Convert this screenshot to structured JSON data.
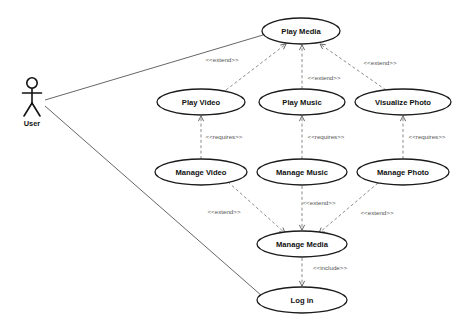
{
  "diagram": {
    "type": "uml-use-case-diagram",
    "background_color": "#ffffff",
    "stroke_color": "#111111",
    "dependency_color": "#777777",
    "actors": [
      {
        "id": "user",
        "label": "User",
        "x": 32,
        "y": 98,
        "label_x": 32,
        "label_y": 124
      }
    ],
    "use_cases": [
      {
        "id": "play_media",
        "label": "Play Media",
        "cx": 301,
        "cy": 31,
        "rx": 39,
        "ry": 13
      },
      {
        "id": "play_video",
        "label": "Play Video",
        "cx": 201,
        "cy": 102,
        "rx": 44,
        "ry": 13
      },
      {
        "id": "play_music",
        "label": "Play Music",
        "cx": 302,
        "cy": 102,
        "rx": 43,
        "ry": 13
      },
      {
        "id": "visualize_photo",
        "label": "Visualize Photo",
        "cx": 403,
        "cy": 102,
        "rx": 48,
        "ry": 13
      },
      {
        "id": "manage_video",
        "label": "Manage Video",
        "cx": 201,
        "cy": 172,
        "rx": 46,
        "ry": 13
      },
      {
        "id": "manage_music",
        "label": "Manage Music",
        "cx": 302,
        "cy": 172,
        "rx": 45,
        "ry": 13
      },
      {
        "id": "manage_photo",
        "label": "Manage Photo",
        "cx": 403,
        "cy": 172,
        "rx": 46,
        "ry": 13
      },
      {
        "id": "manage_media",
        "label": "Manage Media",
        "cx": 302,
        "cy": 244,
        "rx": 45,
        "ry": 13
      },
      {
        "id": "log_in",
        "label": "Log in",
        "cx": 302,
        "cy": 300,
        "rx": 45,
        "ry": 13
      }
    ],
    "associations": [
      {
        "id": "user-play-media",
        "from": "user",
        "to": "play_media",
        "x1": 45,
        "y1": 100,
        "x2": 263,
        "y2": 35
      },
      {
        "id": "user-log-in",
        "from": "user",
        "to": "log_in",
        "x1": 45,
        "y1": 106,
        "x2": 262,
        "y2": 296
      }
    ],
    "dependencies": [
      {
        "id": "play-video-extends-play-media",
        "from": "play_video",
        "to": "play_media",
        "stereotype": "<<extend>>",
        "label_x": 222,
        "label_y": 60,
        "x1": 226,
        "y1": 90,
        "x2": 286,
        "y2": 44
      },
      {
        "id": "play-music-extends-play-media",
        "from": "play_music",
        "to": "play_media",
        "stereotype": "<<extend>>",
        "label_x": 324,
        "label_y": 78,
        "x1": 302,
        "y1": 89,
        "x2": 302,
        "y2": 45
      },
      {
        "id": "visualize-photo-extends-play-media",
        "from": "visualize_photo",
        "to": "play_media",
        "stereotype": "<<extend>>",
        "label_x": 380,
        "label_y": 63,
        "x1": 386,
        "y1": 90,
        "x2": 320,
        "y2": 44
      },
      {
        "id": "manage-video-requires-play-video",
        "from": "manage_video",
        "to": "play_video",
        "stereotype": "<<requires>>",
        "label_x": 224,
        "label_y": 137,
        "x1": 201,
        "y1": 159,
        "x2": 201,
        "y2": 116
      },
      {
        "id": "manage-music-requires-play-music",
        "from": "manage_music",
        "to": "play_music",
        "stereotype": "<<requires>>",
        "label_x": 326,
        "label_y": 137,
        "x1": 302,
        "y1": 159,
        "x2": 302,
        "y2": 116
      },
      {
        "id": "manage-photo-requires-visualize",
        "from": "manage_photo",
        "to": "visualize_photo",
        "stereotype": "<<requires>>",
        "label_x": 427,
        "label_y": 137,
        "x1": 403,
        "y1": 159,
        "x2": 403,
        "y2": 116
      },
      {
        "id": "manage-video-extends-manage-media",
        "from": "manage_video",
        "to": "manage_media",
        "stereotype": "<<extend>>",
        "label_x": 224,
        "label_y": 212,
        "x1": 228,
        "y1": 182,
        "x2": 285,
        "y2": 233
      },
      {
        "id": "manage-music-extends-manage-media",
        "from": "manage_music",
        "to": "manage_media",
        "stereotype": "<<extend>>",
        "label_x": 319,
        "label_y": 203,
        "x1": 302,
        "y1": 186,
        "x2": 302,
        "y2": 230
      },
      {
        "id": "manage-photo-extends-manage-media",
        "from": "manage_photo",
        "to": "manage_media",
        "stereotype": "<<extend>>",
        "label_x": 377,
        "label_y": 213,
        "x1": 378,
        "y1": 183,
        "x2": 319,
        "y2": 233
      },
      {
        "id": "manage-media-includes-log-in",
        "from": "manage_media",
        "to": "log_in",
        "stereotype": "<<include>>",
        "label_x": 330,
        "label_y": 268,
        "x1": 302,
        "y1": 258,
        "x2": 302,
        "y2": 286
      }
    ]
  }
}
